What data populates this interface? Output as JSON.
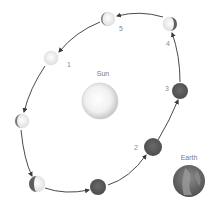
{
  "diagram": {
    "sun": {
      "label": "Sun",
      "cx": 100,
      "cy": 101,
      "r": 18
    },
    "earth": {
      "label": "Earth",
      "cx": 189,
      "cy": 181,
      "r": 16
    },
    "orbit_color": "#4a4a4a",
    "moon_light": "#f2f2f2",
    "moon_dark": "#5a5a5a",
    "moons": [
      {
        "id": "m-1",
        "label": "1",
        "cx": 51,
        "cy": 58,
        "phase": "light",
        "label_x": 66,
        "label_y": 67
      },
      {
        "id": "m-left",
        "label": "",
        "cx": 22,
        "cy": 121,
        "phase": "light-left-sliver",
        "label_x": 0,
        "label_y": 0
      },
      {
        "id": "m-bottom-left",
        "label": "",
        "cx": 37,
        "cy": 184,
        "phase": "half-left-dark",
        "label_x": 0,
        "label_y": 0
      },
      {
        "id": "m-bottom",
        "label": "",
        "cx": 98,
        "cy": 187,
        "phase": "dark",
        "label_x": 0,
        "label_y": 0
      },
      {
        "id": "m-2",
        "label": "2",
        "cx": 153,
        "cy": 147,
        "phase": "dark",
        "label_x": 134,
        "label_y": 149
      },
      {
        "id": "m-3",
        "label": "3",
        "cx": 180,
        "cy": 91,
        "phase": "dark",
        "label_x": 165,
        "label_y": 90
      },
      {
        "id": "m-4",
        "label": "4",
        "cx": 170,
        "cy": 24,
        "phase": "light-right-sliver",
        "label_x": 166,
        "label_y": 45
      },
      {
        "id": "m-5",
        "label": "5",
        "cx": 108,
        "cy": 19,
        "phase": "light-left-sliver",
        "label_x": 119,
        "label_y": 31
      }
    ]
  }
}
